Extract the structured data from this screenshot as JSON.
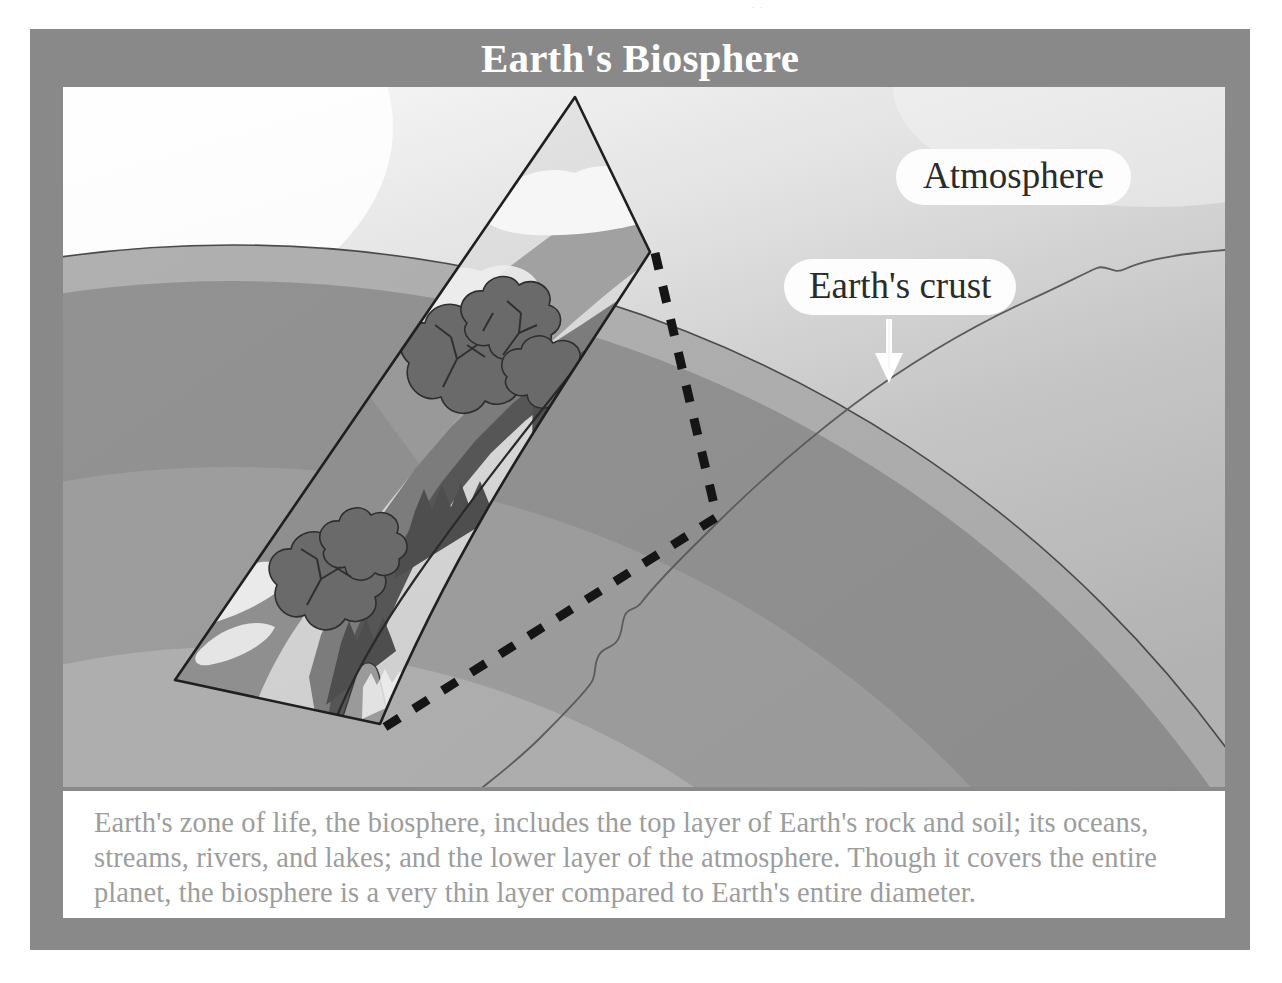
{
  "figure": {
    "title": "Earth's Biosphere",
    "caption": "Earth's zone of life, the biosphere, includes the top layer of Earth's rock and soil; its oceans, streams, rivers, and lakes; and the lower layer of the atmosphere. Though it covers the entire planet, the biosphere is a very thin layer compared to Earth's entire diameter.",
    "scan_artifact": "..",
    "labels": {
      "atmosphere": "Atmosphere",
      "earths_crust": "Earth's crust"
    },
    "colors": {
      "frame": "#898989",
      "panel": "#ffffff",
      "title_text": "#ffffff",
      "caption_text": "#9d9d9d",
      "callout_fill": "#fdfdfd",
      "callout_text": "#2b2b2b",
      "space_light": "#f2f2f2",
      "atmosphere_upper": "#efefef",
      "atmosphere_lower": "#b9b9b9",
      "crust_band": "#a2a2a2",
      "mantle_outer": "#8f8f8f",
      "mantle_inner": "#9d9d9d",
      "core_band": "#ababab",
      "inner_core": "#d5d5d5",
      "outline": "#2a2a2a",
      "vegetation_dark": "#5b5b5b",
      "vegetation_mid": "#7d7d7d",
      "ocean": "#8a8a8a",
      "cloud": "#f5f5f5",
      "arrow": "#ffffff"
    }
  }
}
